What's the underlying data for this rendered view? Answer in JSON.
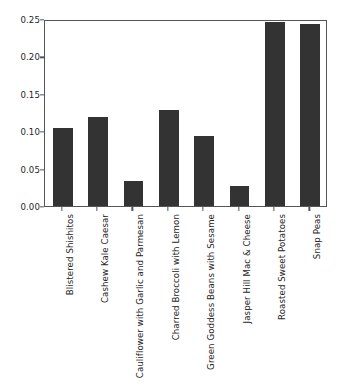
{
  "chart_data": {
    "type": "bar",
    "title": "",
    "xlabel": "",
    "ylabel": "",
    "ylim": [
      0.0,
      0.25
    ],
    "xlim": [
      0,
      8
    ],
    "grid": false,
    "legend": null,
    "bar_color": "#333333",
    "axes_color": "#555555",
    "background_color": "#ffffff",
    "ytick_labels": [
      "0.00",
      "0.05",
      "0.10",
      "0.15",
      "0.20",
      "0.25"
    ],
    "ytick_values": [
      0.0,
      0.05,
      0.1,
      0.15,
      0.2,
      0.25
    ],
    "categories": [
      "Blistered Shishitos",
      "Cashew Kale Caesar",
      "Cauliflower with Garlic and Parmesan",
      "Charred Broccoli with Lemon",
      "Green Goddess Beans with Sesame",
      "Jasper Hill Mac & Cheese",
      "Roasted Sweet Potatoes",
      "Snap Peas"
    ],
    "values": [
      0.104,
      0.119,
      0.033,
      0.128,
      0.094,
      0.027,
      0.246,
      0.243
    ]
  }
}
